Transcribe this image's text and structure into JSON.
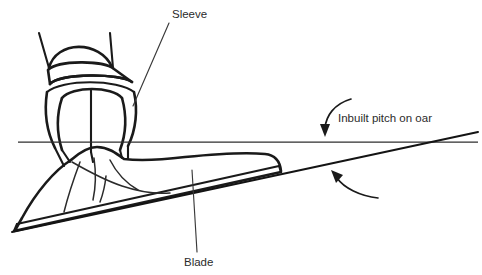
{
  "diagram": {
    "background_color": "#ffffff",
    "ink_color": "#1a1a1a",
    "text_color": "#2b2b2b",
    "width": 482,
    "height": 275
  },
  "labels": {
    "sleeve": "Sleeve",
    "blade": "Blade",
    "inbuilt_pitch": "Inbuilt pitch on oar"
  },
  "label_positions": {
    "sleeve": {
      "x": 172,
      "y": 18
    },
    "blade": {
      "x": 184,
      "y": 266
    },
    "inbuilt_pitch": {
      "x": 338,
      "y": 122
    }
  },
  "leaders": {
    "sleeve_leader": {
      "x1": 169,
      "y1": 23,
      "x2": 133,
      "y2": 106
    },
    "blade_leader": {
      "x1": 192,
      "y1": 170,
      "x2": 197,
      "y2": 252
    }
  },
  "geometry": {
    "reference_line": {
      "x1": 18,
      "y1": 142,
      "x2": 478,
      "y2": 142
    },
    "pitch_line": {
      "x1": 12,
      "y1": 231,
      "x2": 478,
      "y2": 133
    },
    "blade_left_tip": {
      "x": 15,
      "y": 229
    },
    "blade_right_tip": {
      "x": 281,
      "y": 172
    },
    "lines_cross_at": {
      "x": 455,
      "y": 138
    }
  },
  "arrows": {
    "pitch_top_arrow": {
      "name": "pitch-top-arrow",
      "from": {
        "x": 350,
        "y": 99
      },
      "to": {
        "x": 326,
        "y": 134
      },
      "points_to": "reference-line"
    },
    "pitch_bottom_arrow": {
      "name": "pitch-bottom-arrow",
      "from": {
        "x": 375,
        "y": 198
      },
      "to": {
        "x": 335,
        "y": 172
      },
      "points_to": "pitch-line"
    }
  }
}
